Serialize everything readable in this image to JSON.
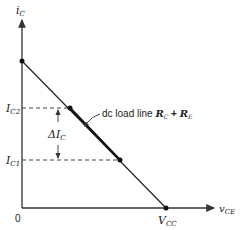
{
  "diagram": {
    "type": "dc-load-line",
    "axes": {
      "y_label": "i",
      "y_label_sub": "C",
      "x_label": "v",
      "x_label_sub": "CE",
      "origin_label": "0"
    },
    "levels": {
      "ic2_main": "I",
      "ic2_sub": "C2",
      "ic1_main": "I",
      "ic1_sub": "C1",
      "delta_main": "ΔI",
      "delta_sub": "C",
      "vcc_main": "V",
      "vcc_sub": "CC"
    },
    "annotation": {
      "text": "dc load line ",
      "rc_main": "R",
      "rc_sub": "C",
      "plus": " + ",
      "re_main": "R",
      "re_sub": "E"
    },
    "colors": {
      "line": "#222222",
      "dashed": "#444444"
    }
  }
}
